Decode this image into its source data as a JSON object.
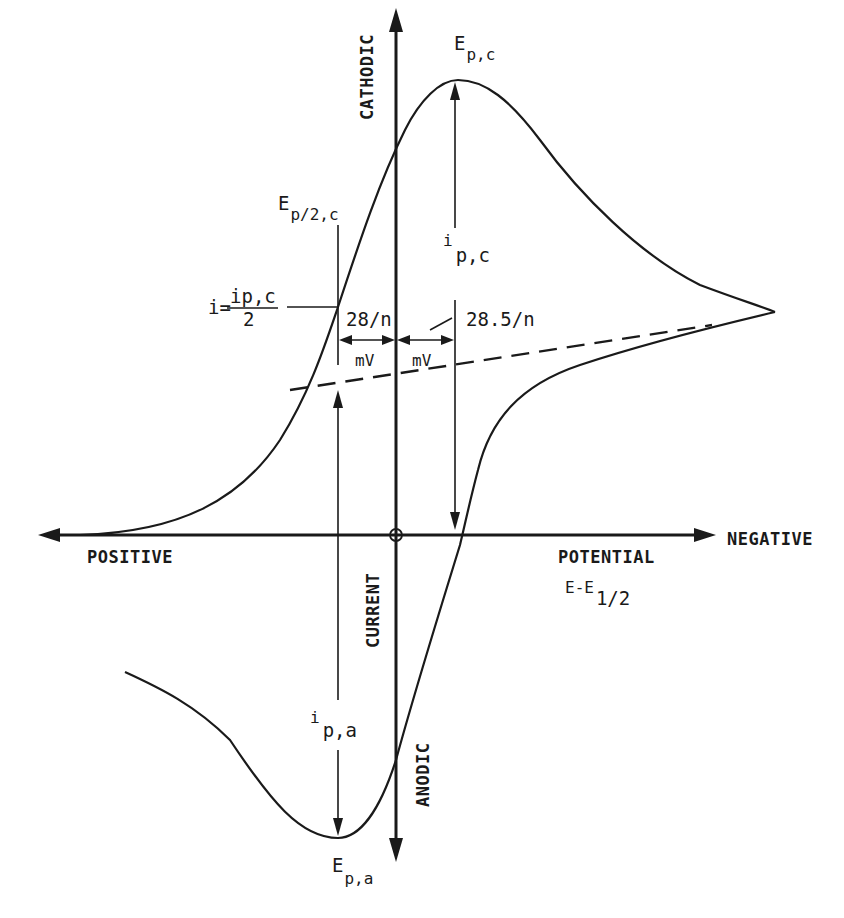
{
  "diagram": {
    "type": "cyclic-voltammogram-schematic",
    "axes": {
      "vertical_top_label": "CATHODIC",
      "vertical_bottom_label": "ANODIC",
      "vertical_axis_label": "CURRENT",
      "horizontal_left_label": "POSITIVE",
      "horizontal_right_label": "NEGATIVE",
      "horizontal_axis_label": "POTENTIAL",
      "horizontal_axis_expr_main": "E-E",
      "horizontal_axis_expr_sub": "1/2"
    },
    "annotations": {
      "cathodic_peak_potential": {
        "main": "E",
        "sub": "p,c"
      },
      "half_peak_potential": {
        "main": "E",
        "sub": "p/2,c"
      },
      "cathodic_peak_current": {
        "main": "i",
        "sub": "p,c"
      },
      "anodic_peak_current": {
        "main": "i",
        "sub": "p,a"
      },
      "anodic_peak_potential": {
        "main": "E",
        "sub": "p,a"
      },
      "half_current_eq": {
        "lhs": "i=",
        "numerator": "ip,c",
        "denominator": "2"
      },
      "left_separation": {
        "value": "28/n",
        "unit": "mV"
      },
      "right_separation": {
        "value": "28.5/n",
        "unit": "mV"
      }
    },
    "features": {
      "forward_scan": "solid curve from positive potential rising to cathodic peak then decaying to switching point",
      "reverse_scan": "solid curve from switching point through anodic peak back toward positive potential",
      "baseline": "dashed extrapolated baseline for cathodic peak current",
      "origin_marker": "circle at axis intersection"
    }
  }
}
